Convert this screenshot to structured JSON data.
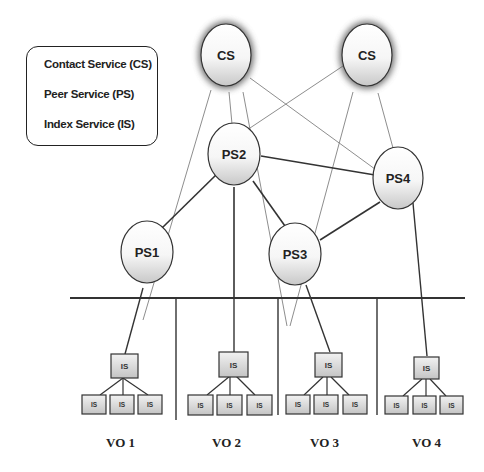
{
  "legend": {
    "items": [
      {
        "label": "Contact Service (CS)"
      },
      {
        "label": "Peer Service (PS)"
      },
      {
        "label": "Index Service (IS)"
      }
    ]
  },
  "nodes": {
    "cs1": {
      "label": "CS"
    },
    "cs2": {
      "label": "CS"
    },
    "ps1": {
      "label": "PS1"
    },
    "ps2": {
      "label": "PS2"
    },
    "ps3": {
      "label": "PS3"
    },
    "ps4": {
      "label": "PS4"
    }
  },
  "index_service_label": "IS",
  "virtual_orgs": [
    {
      "label": "VO 1"
    },
    {
      "label": "VO 2"
    },
    {
      "label": "VO 3"
    },
    {
      "label": "VO 4"
    }
  ],
  "colors": {
    "line": "#333333",
    "thin_line": "#777777",
    "node_fill_top": "#ffffff",
    "node_fill_bottom": "#cfcfcf",
    "cs_glow": "#555555"
  }
}
